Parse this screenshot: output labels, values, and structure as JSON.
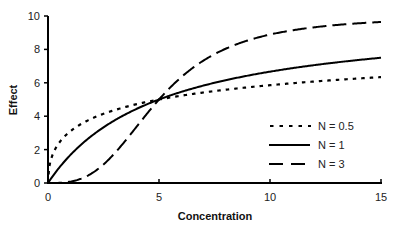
{
  "chart_data": {
    "type": "line",
    "title": "",
    "xlabel": "Concentration",
    "ylabel": "Effect",
    "xlim": [
      0,
      15
    ],
    "ylim": [
      0,
      10
    ],
    "xticks": [
      0,
      5,
      10,
      15
    ],
    "yticks": [
      0,
      2,
      4,
      6,
      8,
      10
    ],
    "grid": false,
    "legend_position": "lower right (inside)",
    "x": [
      0,
      0.25,
      0.5,
      1,
      1.5,
      2,
      2.5,
      3,
      3.5,
      4,
      4.5,
      5,
      5.5,
      6,
      7,
      8,
      9,
      10,
      11,
      12,
      13,
      14,
      15
    ],
    "series": [
      {
        "name": "N = 0.5",
        "style": "dotted",
        "values": [
          0,
          1.83,
          2.4,
          3.09,
          3.54,
          3.87,
          4.14,
          4.36,
          4.55,
          4.72,
          4.87,
          5.0,
          5.12,
          5.23,
          5.42,
          5.59,
          5.73,
          5.86,
          5.97,
          6.08,
          6.17,
          6.26,
          6.34
        ]
      },
      {
        "name": "N = 1",
        "style": "solid",
        "values": [
          0,
          0.48,
          0.91,
          1.67,
          2.31,
          2.86,
          3.33,
          3.75,
          4.12,
          4.44,
          4.74,
          5.0,
          5.24,
          5.45,
          5.83,
          6.15,
          6.43,
          6.67,
          6.88,
          7.06,
          7.22,
          7.37,
          7.5
        ]
      },
      {
        "name": "N = 3",
        "style": "dashed",
        "values": [
          0,
          0.0,
          0.1,
          0.79,
          2.63,
          6.02,
          11.1,
          17.8,
          25.5,
          33.9,
          42.2,
          50.0,
          57.1,
          63.3,
          73.3,
          80.4,
          85.4,
          88.9,
          91.4,
          93.3,
          94.6,
          95.6,
          96.4
        ]
      }
    ],
    "annotations": []
  },
  "legend": {
    "items": [
      {
        "label": "N = 0.5",
        "style": "dotted"
      },
      {
        "label": "N = 1",
        "style": "solid"
      },
      {
        "label": "N = 3",
        "style": "dashed"
      }
    ]
  },
  "axes": {
    "x_title": "Concentration",
    "y_title": "Effect",
    "x_tick_labels": [
      "0",
      "5",
      "10",
      "15"
    ],
    "y_tick_labels": [
      "0",
      "2",
      "4",
      "6",
      "8",
      "10"
    ]
  },
  "colors": {
    "line": "#000000",
    "axis": "#000000",
    "text": "#222222",
    "background": "#ffffff"
  }
}
